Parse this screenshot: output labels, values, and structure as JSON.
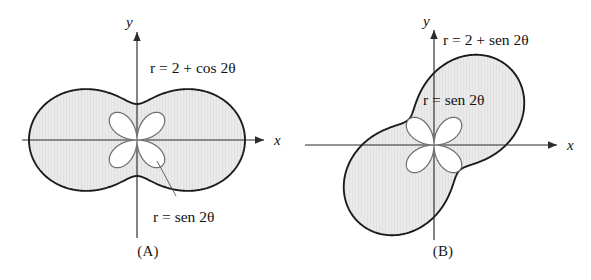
{
  "figure": {
    "background_color": "#ffffff",
    "fill_color": "#e9e9e9",
    "outline_color": "#1c1c1c",
    "rose_color": "#6e6e6e"
  },
  "panels": [
    {
      "id": "A",
      "caption": "(A)",
      "axis_x_label": "x",
      "axis_y_label": "y",
      "outer_label": "r = 2 + cos 2θ",
      "inner_label": "r = sen 2θ",
      "origin": {
        "x": 137,
        "y": 140
      },
      "scale_px_per_unit": 36,
      "rotation_deg": 0
    },
    {
      "id": "B",
      "caption": "(B)",
      "axis_x_label": "x",
      "axis_y_label": "y",
      "outer_label": "r = 2 + sen 2θ",
      "inner_label": "r = sen 2θ",
      "origin": {
        "x": 139,
        "y": 145
      },
      "scale_px_per_unit": 36,
      "rotation_deg": 45
    }
  ],
  "chart_data": {
    "type": "line",
    "title": "",
    "plots": [
      {
        "panel": "A",
        "curves": [
          {
            "name": "outer-limacon",
            "equation": "r = 2 + cos 2θ",
            "label": "r = 2 + cos 2θ",
            "r_max": 3,
            "r_min": 1,
            "shaded": true,
            "theta_range_deg": [
              0,
              360
            ]
          },
          {
            "name": "four-petal-rose",
            "equation": "r = sen 2θ",
            "label": "r = sen 2θ",
            "r_max": 1,
            "petals": 4,
            "shaded": false,
            "theta_range_deg": [
              0,
              360
            ]
          }
        ],
        "axes": {
          "x": "x",
          "y": "y",
          "grid": false
        }
      },
      {
        "panel": "B",
        "curves": [
          {
            "name": "outer-limacon",
            "equation": "r = 2 + sen 2θ",
            "label": "r = 2 + sen 2θ",
            "r_max": 3,
            "r_min": 1,
            "shaded": true,
            "theta_range_deg": [
              0,
              360
            ]
          },
          {
            "name": "four-petal-rose",
            "equation": "r = sen 2θ",
            "label": "r = sen 2θ",
            "r_max": 1,
            "petals": 4,
            "shaded": false,
            "theta_range_deg": [
              0,
              360
            ]
          }
        ],
        "axes": {
          "x": "x",
          "y": "y",
          "grid": false
        }
      }
    ],
    "xlabel": "x",
    "ylabel": "y",
    "legend_position": "inline-annotations"
  }
}
